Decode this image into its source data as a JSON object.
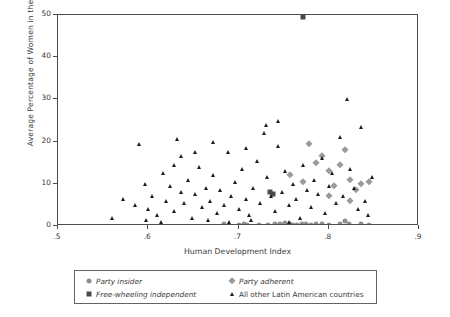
{
  "chart_data": {
    "type": "scatter",
    "title": "",
    "xlabel": "Human Development Index",
    "ylabel": "Average Percentage of Women in the Cabinet",
    "xlim": [
      0.5,
      0.9
    ],
    "ylim": [
      0,
      50
    ],
    "xticks": [
      ".5",
      ".6",
      ".7",
      ".8",
      ".9"
    ],
    "xtick_values": [
      0.5,
      0.6,
      0.7,
      0.8,
      0.9
    ],
    "yticks": [
      "0",
      "10",
      "20",
      "30",
      "40",
      "50"
    ],
    "ytick_values": [
      0,
      10,
      20,
      30,
      40,
      50
    ],
    "grid": false,
    "legend_position": "bottom",
    "series": [
      {
        "name": "Party insider",
        "marker": "circle",
        "color": "#8e8e8e",
        "points": [
          [
            0.684,
            0.4
          ],
          [
            0.7,
            0.3
          ],
          [
            0.706,
            0.5
          ],
          [
            0.709,
            0.2
          ],
          [
            0.723,
            0.3
          ],
          [
            0.74,
            0.4
          ],
          [
            0.746,
            0.5
          ],
          [
            0.75,
            0.3
          ],
          [
            0.752,
            0.6
          ],
          [
            0.757,
            0.4
          ],
          [
            0.765,
            0.3
          ],
          [
            0.77,
            0.5
          ],
          [
            0.775,
            0.4
          ],
          [
            0.78,
            0.3
          ],
          [
            0.786,
            0.4
          ],
          [
            0.8,
            0.3
          ],
          [
            0.812,
            0.5
          ],
          [
            0.818,
            1.2
          ],
          [
            0.822,
            0.4
          ],
          [
            0.836,
            0.4
          ],
          [
            0.845,
            0.3
          ],
          [
            0.792,
            0.4
          ],
          [
            0.76,
            0.2
          ],
          [
            0.733,
            0.3
          ]
        ]
      },
      {
        "name": "Party adherent",
        "marker": "diamond",
        "color": "#9a9a9a",
        "points": [
          [
            0.757,
            12.0
          ],
          [
            0.772,
            10.5
          ],
          [
            0.786,
            15.0
          ],
          [
            0.793,
            16.5
          ],
          [
            0.8,
            13.0
          ],
          [
            0.806,
            9.5
          ],
          [
            0.812,
            14.5
          ],
          [
            0.818,
            18.0
          ],
          [
            0.824,
            11.0
          ],
          [
            0.83,
            8.5
          ],
          [
            0.836,
            10.0
          ],
          [
            0.845,
            10.5
          ],
          [
            0.8,
            7.0
          ],
          [
            0.778,
            19.5
          ],
          [
            0.824,
            6.0
          ]
        ]
      },
      {
        "name": "Free-wheeling independent",
        "marker": "square",
        "color": "#4a4a4a",
        "points": [
          [
            0.772,
            49.5
          ],
          [
            0.735,
            8.0
          ],
          [
            0.738,
            7.6
          ]
        ]
      },
      {
        "name": "All other Latin American countries",
        "marker": "triangle",
        "color": "#1c1c1c",
        "points": [
          [
            0.56,
            2.0
          ],
          [
            0.572,
            6.5
          ],
          [
            0.585,
            5.0
          ],
          [
            0.59,
            19.5
          ],
          [
            0.596,
            10.0
          ],
          [
            0.6,
            4.0
          ],
          [
            0.604,
            7.0
          ],
          [
            0.61,
            2.5
          ],
          [
            0.616,
            12.5
          ],
          [
            0.62,
            6.0
          ],
          [
            0.624,
            9.5
          ],
          [
            0.628,
            3.5
          ],
          [
            0.632,
            20.5
          ],
          [
            0.636,
            8.0
          ],
          [
            0.64,
            5.5
          ],
          [
            0.644,
            11.0
          ],
          [
            0.648,
            2.0
          ],
          [
            0.652,
            7.5
          ],
          [
            0.656,
            14.0
          ],
          [
            0.66,
            4.5
          ],
          [
            0.664,
            9.0
          ],
          [
            0.668,
            6.0
          ],
          [
            0.672,
            12.0
          ],
          [
            0.676,
            3.0
          ],
          [
            0.68,
            8.5
          ],
          [
            0.684,
            5.0
          ],
          [
            0.688,
            17.5
          ],
          [
            0.692,
            7.0
          ],
          [
            0.696,
            10.5
          ],
          [
            0.7,
            4.0
          ],
          [
            0.704,
            13.5
          ],
          [
            0.708,
            6.5
          ],
          [
            0.712,
            2.5
          ],
          [
            0.716,
            9.0
          ],
          [
            0.72,
            15.5
          ],
          [
            0.724,
            5.5
          ],
          [
            0.728,
            22.0
          ],
          [
            0.73,
            24.0
          ],
          [
            0.732,
            11.5
          ],
          [
            0.736,
            7.0
          ],
          [
            0.74,
            3.5
          ],
          [
            0.744,
            19.0
          ],
          [
            0.748,
            8.0
          ],
          [
            0.752,
            13.0
          ],
          [
            0.756,
            5.0
          ],
          [
            0.76,
            10.0
          ],
          [
            0.764,
            6.5
          ],
          [
            0.768,
            2.0
          ],
          [
            0.772,
            14.5
          ],
          [
            0.776,
            8.5
          ],
          [
            0.78,
            4.5
          ],
          [
            0.784,
            11.0
          ],
          [
            0.788,
            7.5
          ],
          [
            0.792,
            16.0
          ],
          [
            0.796,
            3.0
          ],
          [
            0.8,
            9.5
          ],
          [
            0.804,
            12.5
          ],
          [
            0.808,
            5.5
          ],
          [
            0.812,
            21.0
          ],
          [
            0.816,
            7.0
          ],
          [
            0.82,
            30.0
          ],
          [
            0.824,
            13.5
          ],
          [
            0.828,
            9.0
          ],
          [
            0.832,
            4.0
          ],
          [
            0.836,
            23.5
          ],
          [
            0.84,
            6.0
          ],
          [
            0.844,
            2.5
          ],
          [
            0.848,
            11.5
          ],
          [
            0.636,
            16.5
          ],
          [
            0.672,
            20.0
          ],
          [
            0.708,
            18.5
          ],
          [
            0.744,
            25.0
          ],
          [
            0.666,
            1.5
          ],
          [
            0.69,
            1.0
          ],
          [
            0.714,
            1.5
          ],
          [
            0.756,
            1.0
          ],
          [
            0.598,
            1.5
          ],
          [
            0.614,
            1.0
          ],
          [
            0.628,
            14.5
          ],
          [
            0.652,
            17.5
          ]
        ]
      }
    ]
  },
  "legend": {
    "entries": [
      {
        "label": "Party insider",
        "marker": "circle",
        "style": "italic"
      },
      {
        "label": "Party adherent",
        "marker": "diamond",
        "style": "italic"
      },
      {
        "label": "Free-wheeling independent",
        "marker": "square",
        "style": "italic"
      },
      {
        "label": "All other Latin American countries",
        "marker": "triangle",
        "style": "plain"
      }
    ]
  }
}
